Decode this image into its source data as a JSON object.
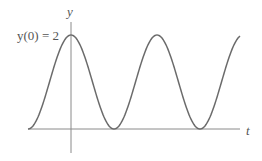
{
  "chart_data": {
    "type": "line",
    "title": "",
    "xlabel": "t",
    "ylabel": "y",
    "annotation": "y(0) = 2",
    "function": "y = 1 + cos(ω t)",
    "series": [
      {
        "name": "y(t)",
        "x": [
          -0.5,
          -0.25,
          0,
          0.25,
          0.5,
          0.75,
          1.0,
          1.25,
          1.5,
          1.75,
          2.0
        ],
        "values": [
          0,
          1,
          2,
          1,
          0,
          1,
          2,
          1,
          0,
          1,
          2
        ]
      }
    ],
    "xlim": [
      -0.5,
      2.0
    ],
    "ylim": [
      0,
      2
    ],
    "grid": false,
    "legend": "none",
    "colors": {
      "curve": "#6b6b6b",
      "axes": "#8a8a8a",
      "text": "#555555"
    }
  },
  "labels": {
    "y_axis": "y",
    "x_axis": "t",
    "initial_value": "y(0) = 2"
  }
}
